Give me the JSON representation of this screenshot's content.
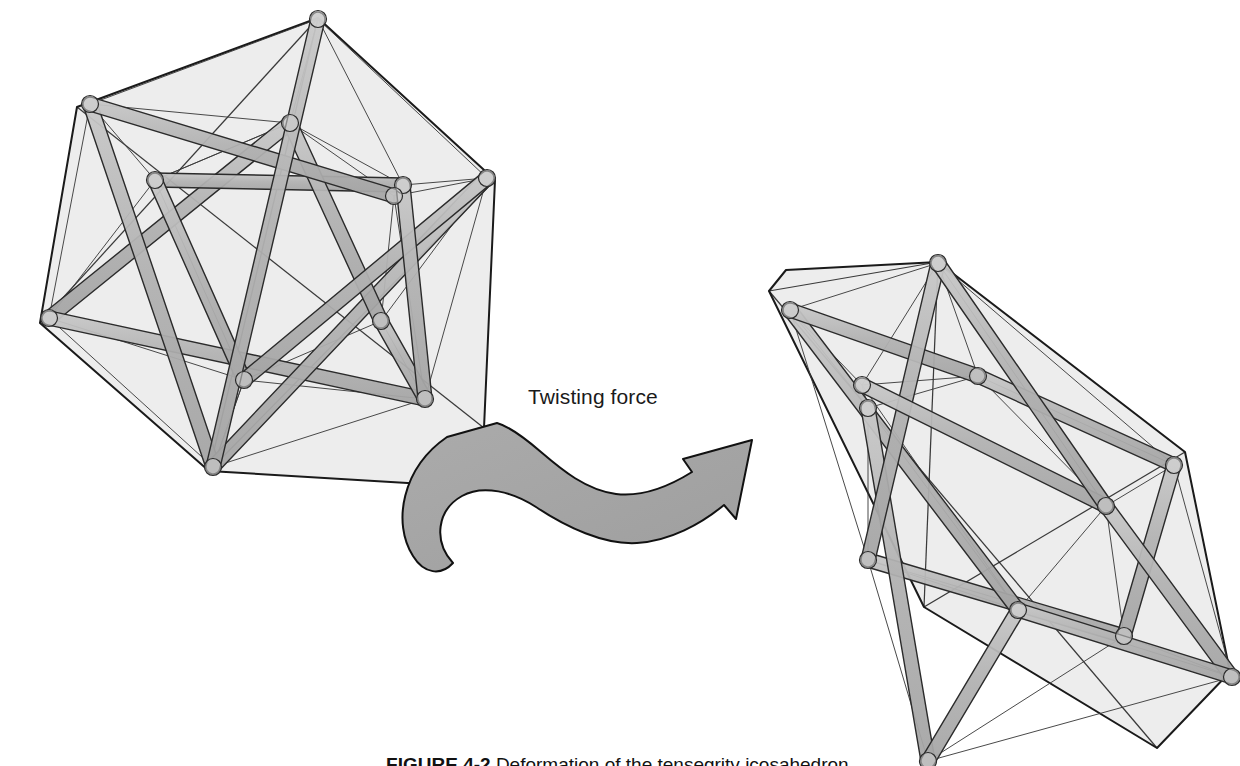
{
  "figure": {
    "domain": "Diagram",
    "background_color": "#ffffff",
    "annotations": {
      "force_label": "Twisting force",
      "caption_label": "FIGURE 4-2",
      "caption_text": "Deformation of the tensegrity icosahedron."
    },
    "colors": {
      "face_fill": "#ececec",
      "face_fill_dark": "#e2e2e2",
      "outline": "#1a1a1a",
      "strut_fill": "#b3b3b3",
      "strut_fill_light": "#c6c6c6",
      "strut_outline": "#2b2b2b",
      "cable_stroke": "#3a3a3a",
      "arrow_fill": "#a6a6a6",
      "arrow_outline": "#111111",
      "node_fill": "#d4d4d4",
      "text_color": "#1a1a1a"
    },
    "stroke_widths": {
      "hull": 2.0,
      "strut": 1.4,
      "cable": 1.0,
      "node": 1.2,
      "arrow": 2.0
    }
  },
  "shapes": [
    {
      "id": "relaxed-icosahedron",
      "name": "Relaxed tensegrity icosahedron",
      "state": "relaxed",
      "hull": [
        [
          318,
          18
        ],
        [
          495,
          180
        ],
        [
          484,
          428
        ],
        [
          424,
          484
        ],
        [
          209,
          471
        ],
        [
          40,
          323
        ],
        [
          77,
          107
        ]
      ],
      "hull_inner_edges": [
        [
          [
            318,
            18
          ],
          [
            40,
            323
          ]
        ],
        [
          [
            318,
            18
          ],
          [
            209,
            471
          ]
        ],
        [
          [
            495,
            180
          ],
          [
            209,
            471
          ]
        ],
        [
          [
            77,
            107
          ],
          [
            484,
            428
          ]
        ]
      ],
      "nodes": [
        [
          318,
          19
        ],
        [
          90,
          104
        ],
        [
          290,
          123
        ],
        [
          403,
          185
        ],
        [
          155,
          180
        ],
        [
          394,
          196
        ],
        [
          49,
          318
        ],
        [
          244,
          380
        ],
        [
          381,
          321
        ],
        [
          213,
          467
        ],
        [
          425,
          399
        ],
        [
          487,
          178
        ]
      ],
      "struts": [
        {
          "a": [
            90,
            104
          ],
          "b": [
            394,
            196
          ],
          "z": 3
        },
        {
          "a": [
            155,
            180
          ],
          "b": [
            244,
            380
          ],
          "z": 2
        },
        {
          "a": [
            318,
            19
          ],
          "b": [
            213,
            467
          ],
          "z": 4
        },
        {
          "a": [
            49,
            318
          ],
          "b": [
            290,
            123
          ],
          "z": 1
        },
        {
          "a": [
            487,
            178
          ],
          "b": [
            244,
            380
          ],
          "z": 3
        },
        {
          "a": [
            381,
            321
          ],
          "b": [
            425,
            399
          ],
          "z": 2
        },
        {
          "a": [
            403,
            185
          ],
          "b": [
            425,
            399
          ],
          "z": 3
        },
        {
          "a": [
            49,
            318
          ],
          "b": [
            425,
            399
          ],
          "z": 1
        },
        {
          "a": [
            213,
            467
          ],
          "b": [
            487,
            178
          ],
          "z": 2
        },
        {
          "a": [
            290,
            123
          ],
          "b": [
            381,
            321
          ],
          "z": 2
        },
        {
          "a": [
            155,
            180
          ],
          "b": [
            403,
            185
          ],
          "z": 1
        },
        {
          "a": [
            90,
            104
          ],
          "b": [
            213,
            467
          ],
          "z": 1
        }
      ],
      "cables": [
        [
          [
            318,
            19
          ],
          [
            290,
            123
          ]
        ],
        [
          [
            318,
            19
          ],
          [
            403,
            185
          ]
        ],
        [
          [
            318,
            19
          ],
          [
            90,
            104
          ]
        ],
        [
          [
            318,
            19
          ],
          [
            487,
            178
          ]
        ],
        [
          [
            90,
            104
          ],
          [
            155,
            180
          ]
        ],
        [
          [
            90,
            104
          ],
          [
            290,
            123
          ]
        ],
        [
          [
            90,
            104
          ],
          [
            49,
            318
          ]
        ],
        [
          [
            290,
            123
          ],
          [
            403,
            185
          ]
        ],
        [
          [
            290,
            123
          ],
          [
            155,
            180
          ]
        ],
        [
          [
            403,
            185
          ],
          [
            394,
            196
          ]
        ],
        [
          [
            403,
            185
          ],
          [
            487,
            178
          ]
        ],
        [
          [
            394,
            196
          ],
          [
            487,
            178
          ]
        ],
        [
          [
            394,
            196
          ],
          [
            381,
            321
          ]
        ],
        [
          [
            155,
            180
          ],
          [
            49,
            318
          ]
        ],
        [
          [
            155,
            180
          ],
          [
            244,
            380
          ]
        ],
        [
          [
            49,
            318
          ],
          [
            244,
            380
          ]
        ],
        [
          [
            49,
            318
          ],
          [
            213,
            467
          ]
        ],
        [
          [
            244,
            380
          ],
          [
            381,
            321
          ]
        ],
        [
          [
            244,
            380
          ],
          [
            213,
            467
          ]
        ],
        [
          [
            381,
            321
          ],
          [
            425,
            399
          ]
        ],
        [
          [
            381,
            321
          ],
          [
            487,
            178
          ]
        ],
        [
          [
            213,
            467
          ],
          [
            425,
            399
          ]
        ],
        [
          [
            425,
            399
          ],
          [
            487,
            178
          ]
        ],
        [
          [
            244,
            380
          ],
          [
            425,
            399
          ]
        ],
        [
          [
            290,
            123
          ],
          [
            394,
            196
          ]
        ],
        [
          [
            155,
            180
          ],
          [
            290,
            123
          ]
        ],
        [
          [
            394,
            196
          ],
          [
            425,
            399
          ]
        ],
        [
          [
            213,
            467
          ],
          [
            244,
            380
          ]
        ]
      ]
    },
    {
      "id": "twisted-icosahedron",
      "name": "Twisted elongated tensegrity icosahedron",
      "state": "twisted",
      "hull": [
        [
          938,
          262
        ],
        [
          1185,
          452
        ],
        [
          1230,
          672
        ],
        [
          1157,
          748
        ],
        [
          924,
          607
        ],
        [
          769,
          291
        ],
        [
          786,
          270
        ]
      ],
      "hull_inner_edges": [
        [
          [
            938,
            262
          ],
          [
            769,
            291
          ]
        ],
        [
          [
            938,
            262
          ],
          [
            924,
            607
          ]
        ],
        [
          [
            1185,
            452
          ],
          [
            924,
            607
          ]
        ],
        [
          [
            769,
            291
          ],
          [
            1157,
            748
          ]
        ]
      ],
      "nodes": [
        [
          938,
          263
        ],
        [
          790,
          310
        ],
        [
          862,
          385
        ],
        [
          978,
          376
        ],
        [
          1174,
          465
        ],
        [
          1106,
          506
        ],
        [
          868,
          560
        ],
        [
          1018,
          610
        ],
        [
          1124,
          636
        ],
        [
          928,
          761
        ],
        [
          1232,
          677
        ],
        [
          868,
          408
        ]
      ],
      "struts": [
        {
          "a": [
            790,
            310
          ],
          "b": [
            978,
            376
          ],
          "z": 2
        },
        {
          "a": [
            862,
            385
          ],
          "b": [
            1106,
            506
          ],
          "z": 3
        },
        {
          "a": [
            938,
            263
          ],
          "b": [
            868,
            560
          ],
          "z": 2
        },
        {
          "a": [
            978,
            376
          ],
          "b": [
            1174,
            465
          ],
          "z": 1
        },
        {
          "a": [
            1174,
            465
          ],
          "b": [
            1124,
            636
          ],
          "z": 2
        },
        {
          "a": [
            1106,
            506
          ],
          "b": [
            1232,
            677
          ],
          "z": 2
        },
        {
          "a": [
            868,
            560
          ],
          "b": [
            1124,
            636
          ],
          "z": 1
        },
        {
          "a": [
            1018,
            610
          ],
          "b": [
            1232,
            677
          ],
          "z": 3
        },
        {
          "a": [
            790,
            310
          ],
          "b": [
            1018,
            610
          ],
          "z": 1
        },
        {
          "a": [
            938,
            263
          ],
          "b": [
            1106,
            506
          ],
          "z": 3
        },
        {
          "a": [
            868,
            408
          ],
          "b": [
            928,
            761
          ],
          "z": 1
        },
        {
          "a": [
            1018,
            610
          ],
          "b": [
            928,
            761
          ],
          "z": 2
        }
      ],
      "cables": [
        [
          [
            938,
            263
          ],
          [
            790,
            310
          ]
        ],
        [
          [
            938,
            263
          ],
          [
            978,
            376
          ]
        ],
        [
          [
            938,
            263
          ],
          [
            862,
            385
          ]
        ],
        [
          [
            938,
            263
          ],
          [
            1174,
            465
          ]
        ],
        [
          [
            790,
            310
          ],
          [
            862,
            385
          ]
        ],
        [
          [
            790,
            310
          ],
          [
            868,
            408
          ]
        ],
        [
          [
            862,
            385
          ],
          [
            978,
            376
          ]
        ],
        [
          [
            862,
            385
          ],
          [
            868,
            408
          ]
        ],
        [
          [
            978,
            376
          ],
          [
            1106,
            506
          ]
        ],
        [
          [
            978,
            376
          ],
          [
            1174,
            465
          ]
        ],
        [
          [
            1174,
            465
          ],
          [
            1106,
            506
          ]
        ],
        [
          [
            1174,
            465
          ],
          [
            1232,
            677
          ]
        ],
        [
          [
            868,
            408
          ],
          [
            868,
            560
          ]
        ],
        [
          [
            868,
            408
          ],
          [
            1018,
            610
          ]
        ],
        [
          [
            1106,
            506
          ],
          [
            1124,
            636
          ]
        ],
        [
          [
            1106,
            506
          ],
          [
            1018,
            610
          ]
        ],
        [
          [
            868,
            560
          ],
          [
            1018,
            610
          ]
        ],
        [
          [
            868,
            560
          ],
          [
            928,
            761
          ]
        ],
        [
          [
            1018,
            610
          ],
          [
            1124,
            636
          ]
        ],
        [
          [
            1124,
            636
          ],
          [
            1232,
            677
          ]
        ],
        [
          [
            1124,
            636
          ],
          [
            928,
            761
          ]
        ],
        [
          [
            928,
            761
          ],
          [
            1232,
            677
          ]
        ],
        [
          [
            790,
            310
          ],
          [
            868,
            560
          ]
        ],
        [
          [
            862,
            385
          ],
          [
            1018,
            610
          ]
        ],
        [
          [
            1018,
            610
          ],
          [
            1232,
            677
          ]
        ],
        [
          [
            978,
            376
          ],
          [
            868,
            408
          ]
        ],
        [
          [
            868,
            560
          ],
          [
            1124,
            636
          ]
        ],
        [
          [
            938,
            263
          ],
          [
            1106,
            506
          ]
        ]
      ]
    }
  ],
  "arrow": {
    "name": "twisting-force-arrow",
    "type": "curved-swoosh-arrow",
    "direction": "left-to-right",
    "path": "M 497,423 L 447,437 C 402,468 392,523 413,556 C 424,574 441,576 453,563 C 433,541 437,510 462,496 C 483,484 513,492 536,507 C 566,527 604,545 637,543 C 670,541 701,524 724,505 L 736,519 L 752,440 L 683,459 L 692,472 C 668,487 641,497 616,494 C 586,490 562,470 541,452 C 519,433 504,425 497,423 Z"
  }
}
